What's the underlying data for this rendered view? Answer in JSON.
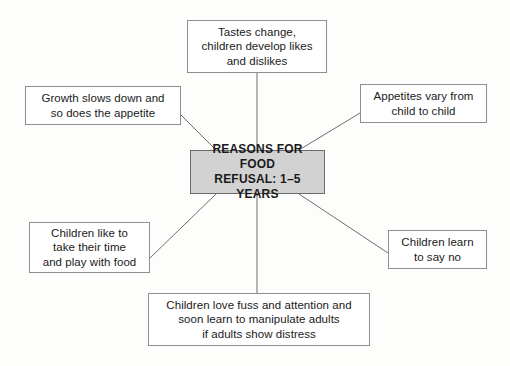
{
  "diagram": {
    "type": "spider-map",
    "center": {
      "id": "center",
      "label": "REASONS FOR FOOD\nREFUSAL: 1–5 YEARS",
      "fill_color": "#d2d2d2",
      "border_color": "#6b6b6b"
    },
    "branches": [
      {
        "id": "top",
        "position": "top",
        "label": "Tastes change,\nchildren develop likes\nand dislikes"
      },
      {
        "id": "left-top",
        "position": "left-top",
        "label": "Growth slows down and\nso does the appetite"
      },
      {
        "id": "right-top",
        "position": "right-top",
        "label": "Appetites vary from\nchild to child"
      },
      {
        "id": "left-bottom",
        "position": "left-bottom",
        "label": "Children like to\ntake their time\nand play with food"
      },
      {
        "id": "right-bottom",
        "position": "right-bottom",
        "label": "Children learn\nto say no"
      },
      {
        "id": "bottom",
        "position": "bottom",
        "label": "Children love fuss and attention and\nsoon learn to manipulate adults\nif adults show distress"
      }
    ],
    "connector_color": "#6e6e6e",
    "background_color": "#fdfdfc",
    "node_border_color": "#8e8e8e",
    "text_color": "#1a1a1a"
  }
}
